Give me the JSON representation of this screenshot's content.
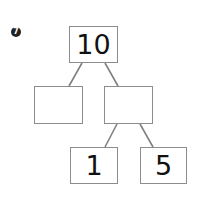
{
  "problem": {
    "number": "7",
    "nodes": {
      "root": "10",
      "left": "",
      "right": "",
      "right_left": "1",
      "right_right": "5"
    }
  }
}
